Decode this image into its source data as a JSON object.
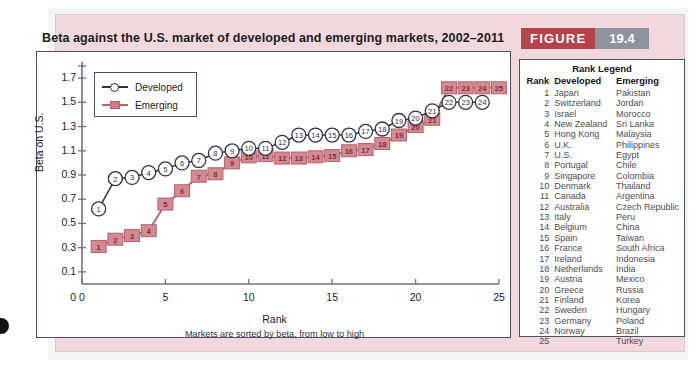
{
  "figure": {
    "badge_label": "FIGURE",
    "badge_number": "19.4",
    "badge_color": "#b5434a",
    "badge_number_color": "#8d949e",
    "title": "Beta against the U.S. market of developed and emerging markets, 2002–2011"
  },
  "rank_legend": {
    "title": "Rank Legend",
    "columns": [
      "Rank",
      "Developed",
      "Emerging"
    ],
    "rows": [
      [
        "1",
        "Japan",
        "Pakistan"
      ],
      [
        "2",
        "Switzerland",
        "Jordan"
      ],
      [
        "3",
        "Israel",
        "Morocco"
      ],
      [
        "4",
        "New Zealand",
        "Sri Lanka"
      ],
      [
        "5",
        "Hong Kong",
        "Malaysia"
      ],
      [
        "6",
        "U.K.",
        "Philippines"
      ],
      [
        "7",
        "U.S.",
        "Egypt"
      ],
      [
        "8",
        "Portugal",
        "Chile"
      ],
      [
        "9",
        "Singapore",
        "Colombia"
      ],
      [
        "10",
        "Denmark",
        "Thailand"
      ],
      [
        "11",
        "Canada",
        "Argentina"
      ],
      [
        "12",
        "Australia",
        "Czech Republic"
      ],
      [
        "13",
        "Italy",
        "Peru"
      ],
      [
        "14",
        "Belgium",
        "China"
      ],
      [
        "15",
        "Spain",
        "Taiwan"
      ],
      [
        "16",
        "France",
        "South Africa"
      ],
      [
        "17",
        "Ireland",
        "Indonesia"
      ],
      [
        "18",
        "Netherlands",
        "India"
      ],
      [
        "19",
        "Austria",
        "Mexico"
      ],
      [
        "20",
        "Greece",
        "Russia"
      ],
      [
        "21",
        "Finland",
        "Korea"
      ],
      [
        "22",
        "Sweden",
        "Hungary"
      ],
      [
        "23",
        "Germany",
        "Poland"
      ],
      [
        "24",
        "Norway",
        "Brazil"
      ],
      [
        "25",
        "",
        "Turkey"
      ]
    ]
  },
  "chart_data": {
    "type": "line",
    "title": "Beta against the U.S. market of developed and emerging markets, 2002–2011",
    "xlabel": "Rank",
    "ylabel": "Beta on U.S.",
    "caption": "Markets are sorted by beta, from low to high",
    "xlim": [
      0,
      25
    ],
    "ylim": [
      0,
      1.8
    ],
    "xticks": [
      "0",
      "5",
      "10",
      "15",
      "20",
      "25"
    ],
    "xtick_values": [
      0,
      5,
      10,
      15,
      20,
      25
    ],
    "yticks": [
      "0.1",
      "0.3",
      "0.5",
      "0.7",
      "0.9",
      "1.1",
      "1.3",
      "1.5",
      "1.7"
    ],
    "ytick_values": [
      0.1,
      0.3,
      0.5,
      0.7,
      0.9,
      1.1,
      1.3,
      1.5,
      1.7
    ],
    "y_origin_label": "0",
    "grid": false,
    "legend_position": "top-left",
    "series": [
      {
        "name": "Developed",
        "color": "#2f3146",
        "marker": "circle-open",
        "x": [
          1,
          2,
          3,
          4,
          5,
          6,
          7,
          8,
          9,
          10,
          11,
          12,
          13,
          14,
          15,
          16,
          17,
          18,
          19,
          20,
          21,
          22,
          23,
          24
        ],
        "values": [
          0.62,
          0.87,
          0.88,
          0.92,
          0.95,
          1.0,
          1.02,
          1.08,
          1.1,
          1.12,
          1.12,
          1.17,
          1.23,
          1.23,
          1.23,
          1.23,
          1.26,
          1.28,
          1.35,
          1.37,
          1.43,
          1.5,
          1.5,
          1.5
        ]
      },
      {
        "name": "Emerging",
        "color": "#cf7f87",
        "marker": "square-filled",
        "x": [
          1,
          2,
          3,
          4,
          5,
          6,
          7,
          8,
          9,
          10,
          11,
          12,
          13,
          14,
          15,
          16,
          17,
          18,
          19,
          20,
          21,
          22,
          23,
          24,
          25
        ],
        "values": [
          0.31,
          0.37,
          0.4,
          0.44,
          0.66,
          0.77,
          0.89,
          0.91,
          1.0,
          1.05,
          1.06,
          1.04,
          1.04,
          1.05,
          1.06,
          1.1,
          1.11,
          1.16,
          1.23,
          1.3,
          1.36,
          1.62,
          1.62,
          1.62,
          1.62
        ]
      }
    ]
  }
}
